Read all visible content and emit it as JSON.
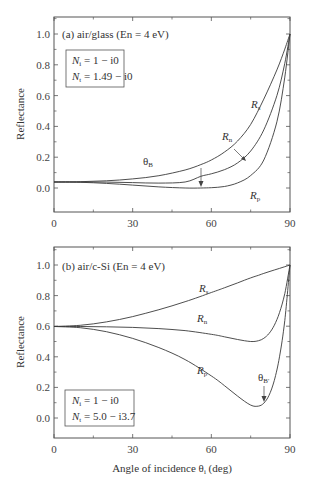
{
  "chart_data": [
    {
      "type": "line",
      "title": "(a) air/glass (En = 4 eV)",
      "xlabel": "",
      "ylabel": "Reflectance",
      "xlim": [
        0,
        90
      ],
      "ylim": [
        -0.1,
        1.1
      ],
      "xticks": [
        0,
        30,
        60,
        90
      ],
      "yticks": [
        0.0,
        0.2,
        0.4,
        0.6,
        0.8,
        1.0
      ],
      "ytick_labels": [
        "0.0",
        "0.2",
        "0.4",
        "0.6",
        "0.8",
        "1.0"
      ],
      "grid": false,
      "legend_box": [
        "N_i = 1 − i0",
        "N_t = 1.49 − i0"
      ],
      "x": [
        0,
        10,
        20,
        30,
        40,
        50,
        56,
        60,
        65,
        70,
        75,
        80,
        85,
        88,
        90
      ],
      "series": [
        {
          "name": "R_s",
          "values": [
            0.039,
            0.041,
            0.047,
            0.059,
            0.08,
            0.117,
            0.152,
            0.182,
            0.233,
            0.305,
            0.413,
            0.577,
            0.767,
            0.902,
            1.0
          ]
        },
        {
          "name": "R_n",
          "values": [
            0.039,
            0.039,
            0.038,
            0.035,
            0.032,
            0.039,
            0.076,
            0.092,
            0.119,
            0.163,
            0.24,
            0.377,
            0.6,
            0.81,
            1.0
          ]
        },
        {
          "name": "R_p",
          "values": [
            0.039,
            0.037,
            0.03,
            0.019,
            0.007,
            0.0,
            0.0,
            0.002,
            0.01,
            0.033,
            0.081,
            0.182,
            0.43,
            0.72,
            1.0
          ]
        }
      ],
      "annotations": [
        {
          "text": "R_s",
          "x": 77,
          "y": 0.63
        },
        {
          "text": "R_n",
          "x": 68,
          "y": 0.37
        },
        {
          "text": "R_p",
          "x": 77,
          "y": 0.08
        },
        {
          "text": "θ_B",
          "x": 56,
          "y": 0.18,
          "arrow_to": [
            56,
            0.0
          ]
        }
      ]
    },
    {
      "type": "line",
      "title": "(b) air/c-Si (En = 4 eV)",
      "xlabel": "Angle of incidence θ_i (deg)",
      "ylabel": "Reflectance",
      "xlim": [
        0,
        90
      ],
      "ylim": [
        -0.1,
        1.1
      ],
      "xticks": [
        0,
        30,
        60,
        90
      ],
      "yticks": [
        0.0,
        0.2,
        0.4,
        0.6,
        0.8,
        1.0
      ],
      "ytick_labels": [
        "0.0",
        "0.2",
        "0.4",
        "0.6",
        "0.8",
        "1.0"
      ],
      "grid": false,
      "legend_box": [
        "N_i = 1 − i0",
        "N_t = 5.0 − i3.7"
      ],
      "x": [
        0,
        10,
        20,
        30,
        40,
        50,
        60,
        65,
        70,
        75,
        78,
        80,
        82,
        84,
        86,
        88,
        90
      ],
      "series": [
        {
          "name": "R_s",
          "values": [
            0.598,
            0.606,
            0.628,
            0.663,
            0.708,
            0.76,
            0.82,
            0.851,
            0.883,
            0.916,
            0.933,
            0.945,
            0.956,
            0.967,
            0.978,
            0.989,
            1.0
          ]
        },
        {
          "name": "R_n",
          "values": [
            0.598,
            0.598,
            0.596,
            0.592,
            0.584,
            0.571,
            0.547,
            0.531,
            0.513,
            0.5,
            0.505,
            0.521,
            0.552,
            0.606,
            0.689,
            0.813,
            1.0
          ]
        },
        {
          "name": "R_p",
          "values": [
            0.598,
            0.59,
            0.564,
            0.52,
            0.46,
            0.382,
            0.275,
            0.212,
            0.143,
            0.084,
            0.078,
            0.097,
            0.148,
            0.245,
            0.4,
            0.637,
            1.0
          ]
        }
      ],
      "annotations": [
        {
          "text": "R_s",
          "x": 48,
          "y": 0.73
        },
        {
          "text": "R_n",
          "x": 48,
          "y": 0.6
        },
        {
          "text": "R_p",
          "x": 48,
          "y": 0.4
        },
        {
          "text": "θ_B'",
          "x": 80,
          "y": 0.26,
          "arrow_to": [
            80,
            0.1
          ]
        }
      ]
    }
  ],
  "labels": {
    "ylabel": "Reflectance",
    "xlabel_main": "Angle of incidence θ",
    "xlabel_sub": "i",
    "xlabel_unit": " (deg)",
    "panel_a_title": "(a) air/glass (En = 4 eV)",
    "panel_b_title": "(b) air/c-Si (En = 4 eV)",
    "a_box_line1_N": "N",
    "a_box_line1_sub": "i",
    "a_box_line1_val": " = 1 − i0",
    "a_box_line2_N": "N",
    "a_box_line2_sub": "t",
    "a_box_line2_val": " = 1.49 − i0",
    "b_box_line1_N": "N",
    "b_box_line1_sub": "i",
    "b_box_line1_val": " = 1 − i0",
    "b_box_line2_N": "N",
    "b_box_line2_sub": "t",
    "b_box_line2_val": " = 5.0 − i3.7",
    "R": "R",
    "sub_s": "s",
    "sub_n": "n",
    "sub_p": "p",
    "theta": "θ",
    "sub_B": "B",
    "sub_Bp": "B'"
  },
  "colors": {
    "line": "#3a3a3a",
    "axis": "#555555",
    "text": "#333333",
    "background": "#ffffff"
  }
}
